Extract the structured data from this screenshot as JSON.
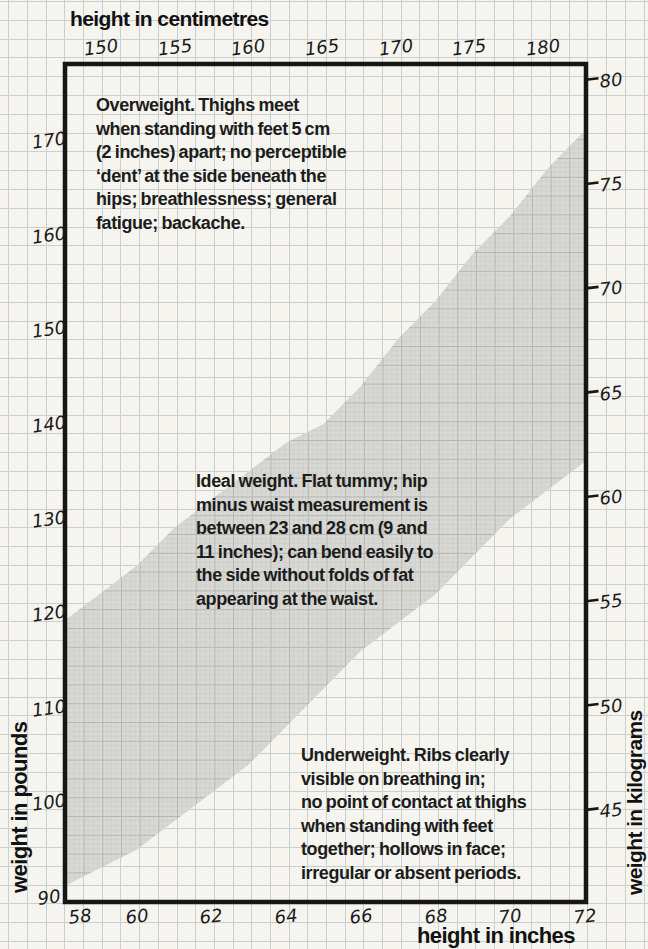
{
  "annotations": {
    "overweight": {
      "text": "Overweight. Thighs meet\nwhen standing with feet 5 cm\n(2 inches) apart; no perceptible\n‘dent’ at the side beneath the\nhips; breathlessness; general\nfatigue; backache."
    },
    "ideal": {
      "text": "Ideal weight. Flat tummy; hip\nminus waist measurement is\nbetween 23 and 28 cm (9 and\n11 inches); can bend easily to\nthe side without folds of fat\nappearing at the waist."
    },
    "underweight": {
      "text": "Underweight. Ribs clearly\nvisible on breathing in;\nno point of contact at thighs\nwhen standing with feet\ntogether; hollows in face;\nirregular or absent periods."
    }
  },
  "chart_data": {
    "type": "area",
    "title": "",
    "grid": true,
    "legend": false,
    "band_color": "#d8d8d5",
    "paper_color": "#f5f4ef",
    "grid_color": "#ccd0cc",
    "ink_color": "#161616",
    "axes": {
      "top": {
        "label": "height in centimetres",
        "unit": "cm",
        "ticks": [
          150,
          155,
          160,
          165,
          170,
          175,
          180
        ]
      },
      "bottom": {
        "label": "height in inches",
        "unit": "in",
        "ticks": [
          58,
          60,
          62,
          64,
          66,
          68,
          70,
          72
        ],
        "range": [
          58,
          72
        ]
      },
      "left": {
        "label": "weight in pounds",
        "unit": "lb",
        "ticks": [
          90,
          100,
          110,
          120,
          130,
          140,
          150,
          160,
          170
        ],
        "range": [
          90,
          178
        ]
      },
      "right": {
        "label": "weight in kilograms",
        "unit": "kg",
        "ticks": [
          45,
          50,
          55,
          60,
          65,
          70,
          75,
          80
        ]
      }
    },
    "zones": [
      "Overweight",
      "Ideal weight",
      "Underweight"
    ],
    "series": [
      {
        "name": "ideal-weight-band",
        "kind": "band",
        "x_inches": [
          58,
          59,
          60,
          61,
          62,
          63,
          64,
          65,
          66,
          67,
          68,
          69,
          70,
          71,
          72
        ],
        "lower_lbs": [
          91,
          93,
          95,
          98,
          101,
          104,
          108,
          112,
          116,
          119,
          122,
          126,
          130,
          133,
          136
        ],
        "upper_lbs": [
          119,
          122,
          125,
          129,
          132,
          135,
          138,
          140,
          144,
          149,
          153,
          158,
          162,
          167,
          171
        ]
      }
    ]
  }
}
